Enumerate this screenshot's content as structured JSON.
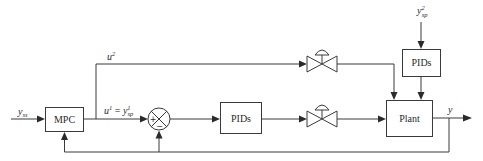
{
  "diagram": {
    "blocks": {
      "mpc": {
        "label": "MPC"
      },
      "pids_inner": {
        "label": "PIDs"
      },
      "pids_outer": {
        "label": "PIDs"
      },
      "plant": {
        "label": "Plant"
      }
    },
    "summing_junction": {
      "plus": "+",
      "minus": "−"
    },
    "signals": {
      "input": {
        "base": "y",
        "sub": "ss"
      },
      "u2": {
        "base": "u",
        "sup": "2"
      },
      "u1": {
        "base": "u",
        "sup": "1",
        "eq": " = ",
        "rhs_base": "y",
        "rhs_sup": "1",
        "rhs_sub": "sp"
      },
      "y_sp2": {
        "base": "y",
        "sup": "2",
        "sub": "sp"
      },
      "output": {
        "base": "y"
      }
    },
    "valves": [
      {
        "name": "upper-control-valve"
      },
      {
        "name": "lower-control-valve"
      }
    ],
    "colors": {
      "line": "#3a3a3a",
      "text": "#2a2a2a",
      "background": "#ffffff"
    }
  }
}
